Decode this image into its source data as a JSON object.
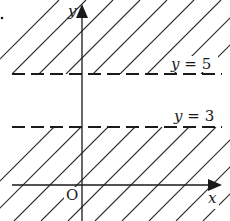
{
  "figure": {
    "type": "inequality-region-diagram",
    "colors": {
      "ink": "#1a1a1a",
      "background": "#ffffff"
    },
    "axes": {
      "x_label": "x",
      "y_label": "y",
      "origin_label": "O"
    },
    "boundaries": [
      {
        "equation": "y = 5",
        "var": "y",
        "op": "=",
        "value": "5",
        "style": "dashed"
      },
      {
        "equation": "y = 3",
        "var": "y",
        "op": "=",
        "value": "3",
        "style": "dashed"
      }
    ],
    "shaded_regions": [
      "y > 5",
      "y < 3"
    ],
    "unshaded_band": "3 ≤ y ≤ 5"
  }
}
